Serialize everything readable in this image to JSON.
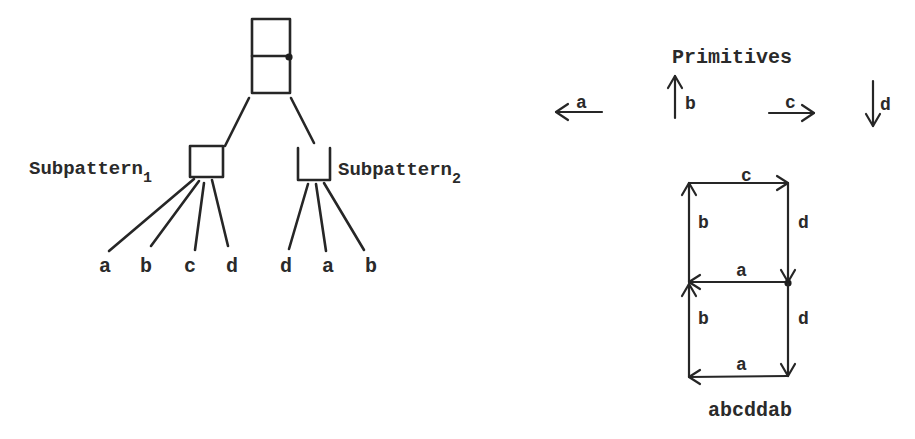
{
  "tree": {
    "root": {
      "shape": "two stacked squares with connection dot"
    },
    "subpatterns": [
      {
        "label": "Subpattern",
        "subscript": "1",
        "shape": "square",
        "children": [
          "a",
          "b",
          "c",
          "d"
        ]
      },
      {
        "label": "Subpattern",
        "subscript": "2",
        "shape": "open-top square",
        "children": [
          "d",
          "a",
          "b"
        ]
      }
    ]
  },
  "primitives": {
    "title": "Primitives",
    "items": [
      {
        "label": "a",
        "direction": "left"
      },
      {
        "label": "b",
        "direction": "up"
      },
      {
        "label": "c",
        "direction": "right"
      },
      {
        "label": "d",
        "direction": "down"
      }
    ]
  },
  "figure": {
    "edges": [
      {
        "label": "c",
        "position": "top"
      },
      {
        "label": "b",
        "position": "upper-left"
      },
      {
        "label": "d",
        "position": "upper-right"
      },
      {
        "label": "a",
        "position": "middle"
      },
      {
        "label": "b",
        "position": "lower-left"
      },
      {
        "label": "d",
        "position": "lower-right"
      },
      {
        "label": "a",
        "position": "bottom"
      }
    ],
    "string": "abcddab"
  },
  "colors": {
    "ink": "#262626",
    "background": "#ffffff"
  }
}
